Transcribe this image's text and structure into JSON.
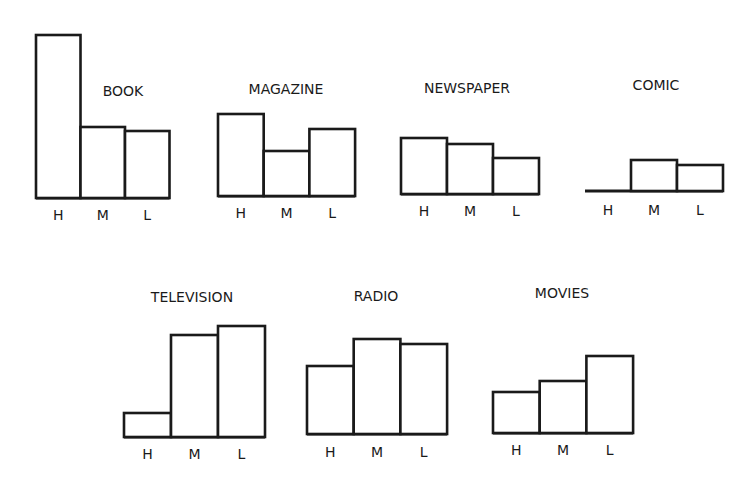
{
  "chart_data": {
    "type": "bar",
    "title": "",
    "xlabel": "",
    "ylabel": "",
    "grid": false,
    "legend": null,
    "note": "Small-multiple bar charts; no numeric axis shown. Values are relative bar heights in pixels measured from the figure.",
    "categories": [
      "H",
      "M",
      "L"
    ],
    "panels": [
      {
        "title": "BOOK",
        "values": [
          163,
          71,
          67
        ]
      },
      {
        "title": "MAGAZINE",
        "values": [
          82,
          45,
          67
        ]
      },
      {
        "title": "NEWSPAPER",
        "values": [
          56,
          50,
          36
        ]
      },
      {
        "title": "COMIC",
        "values": [
          0,
          31,
          26
        ]
      },
      {
        "title": "TELEVISION",
        "values": [
          24,
          102,
          111
        ]
      },
      {
        "title": "RADIO",
        "values": [
          68,
          95,
          90
        ]
      },
      {
        "title": "MOVIES",
        "values": [
          41,
          52,
          77
        ]
      }
    ]
  },
  "layout": {
    "panels": [
      {
        "x": 36,
        "baseline": 198,
        "barW": 44.5,
        "titleX": 123,
        "titleY": 96,
        "labelY": 220
      },
      {
        "x": 218,
        "baseline": 196,
        "barW": 45.7,
        "titleX": 286,
        "titleY": 94,
        "labelY": 218
      },
      {
        "x": 401,
        "baseline": 194,
        "barW": 46,
        "titleX": 467,
        "titleY": 93,
        "labelY": 216
      },
      {
        "x": 585,
        "baseline": 191,
        "barW": 46,
        "titleX": 656,
        "titleY": 90,
        "labelY": 215
      },
      {
        "x": 124,
        "baseline": 437,
        "barW": 47,
        "titleX": 192,
        "titleY": 302,
        "labelY": 459
      },
      {
        "x": 307,
        "baseline": 434,
        "barW": 46.7,
        "titleX": 376,
        "titleY": 301,
        "labelY": 457
      },
      {
        "x": 493,
        "baseline": 433,
        "barW": 46.7,
        "titleX": 562,
        "titleY": 298,
        "labelY": 455
      }
    ],
    "stroke": "#1a1a1a",
    "fill": "#ffffff"
  }
}
